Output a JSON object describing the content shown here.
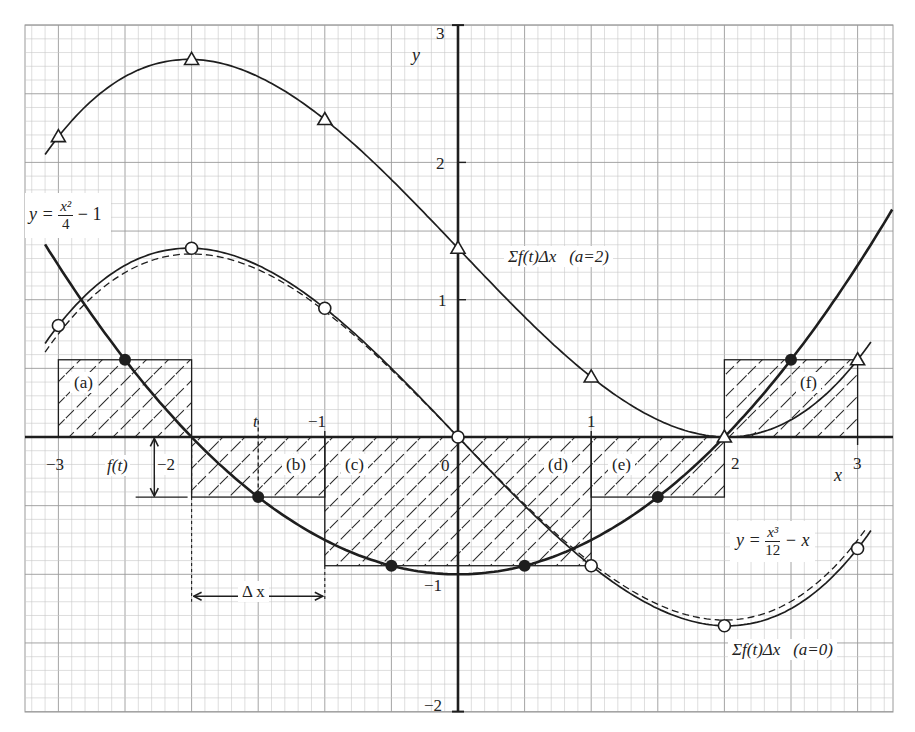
{
  "chart_data": {
    "type": "line",
    "title": "",
    "xlabel": "x",
    "ylabel": "y",
    "xlim": [
      -3.3,
      3.26
    ],
    "ylim": [
      -2.0,
      3.0
    ],
    "grid": true,
    "x_ticks": [
      "-3",
      "-2",
      "-1",
      "0",
      "1",
      "2",
      "3"
    ],
    "y_ticks": [
      "3",
      "2",
      "1",
      "0",
      "-1",
      "-2"
    ],
    "series": [
      {
        "name": "y = x^2/4 - 1",
        "label_text": "y = x²/4 − 1",
        "style": "solid-bold",
        "domain": [
          -3.1,
          3.26
        ],
        "markers": "filled-circle",
        "marker_points": [
          [
            -2.5,
            0.5625
          ],
          [
            -1.5,
            -0.4375
          ],
          [
            -0.5,
            -0.9375
          ],
          [
            0.5,
            -0.9375
          ],
          [
            1.5,
            -0.4375
          ],
          [
            2.5,
            0.5625
          ]
        ]
      },
      {
        "name": "Σf(t)Δx (a=0)",
        "label_text": "Σf(t)Δx   (a=0)",
        "style": "solid",
        "markers": "open-circle",
        "marker_points": [
          [
            -3,
            0.8125
          ],
          [
            -2,
            1.375
          ],
          [
            -1,
            0.9375
          ],
          [
            0,
            0
          ],
          [
            1,
            -0.9375
          ],
          [
            2,
            -1.375
          ],
          [
            3,
            -0.8125
          ]
        ]
      },
      {
        "name": "y = x^3/12 - x",
        "label_text": "y = x³/12 − x",
        "style": "dashed",
        "domain": [
          -3.1,
          3.05
        ]
      },
      {
        "name": "Σf(t)Δx (a=2)",
        "label_text": "Σf(t)Δx   (a=2)",
        "style": "solid",
        "markers": "open-triangle",
        "marker_points": [
          [
            -3,
            2.1875
          ],
          [
            -2,
            2.75
          ],
          [
            -1,
            2.3125
          ],
          [
            0,
            1.375
          ],
          [
            1,
            0.4375
          ],
          [
            2,
            0
          ],
          [
            3,
            0.5625
          ]
        ]
      }
    ],
    "rectangles": [
      {
        "label": "(a)",
        "x0": -3,
        "x1": -2,
        "height": 0.5625
      },
      {
        "label": "(b)",
        "x0": -2,
        "x1": -1,
        "height": -0.4375
      },
      {
        "label": "(c)",
        "x0": -1,
        "x1": 0,
        "height": -0.9375
      },
      {
        "label": "(d)",
        "x0": 0,
        "x1": 1,
        "height": -0.9375
      },
      {
        "label": "(e)",
        "x0": 1,
        "x1": 2,
        "height": -0.4375
      },
      {
        "label": "(f)",
        "x0": 2,
        "x1": 3,
        "height": 0.5625
      }
    ],
    "annotations": [
      "t",
      "f(t)",
      "Δx"
    ]
  },
  "labels": {
    "axis_x": "x",
    "axis_y": "y",
    "tick_x": {
      "m3": "−3",
      "m2": "−2",
      "m1": "−1",
      "zero": "0",
      "p1": "1",
      "p2": "2",
      "p3": "3"
    },
    "tick_y": {
      "p3": "3",
      "p2": "2",
      "p1": "1",
      "m1": "−1",
      "m2": "−2"
    },
    "t": "t",
    "ft": "f(t)",
    "dx": "Δ x",
    "rect_a": "(a)",
    "rect_b": "(b)",
    "rect_c": "(c)",
    "rect_d": "(d)",
    "rect_e": "(e)",
    "rect_f": "(f)",
    "parabola_lhs": "y =",
    "parabola_num": "x²",
    "parabola_den": "4",
    "parabola_rhs": "− 1",
    "cubic_lhs": "y =",
    "cubic_num": "x³",
    "cubic_den": "12",
    "cubic_rhs": "− x",
    "sum_a2": "Σf(t)Δx   (a=2)",
    "sum_a0": "Σf(t)Δx   (a=0)"
  },
  "layout": {
    "origin_px": [
      458,
      437
    ],
    "unit_x_px": 133.2,
    "unit_y_px": 137.3,
    "frame": [
      25,
      25,
      893,
      712
    ],
    "colors": {
      "ink": "#1e1e1e",
      "grid_fine": "#c8c8c8",
      "grid_major": "#9a9a9a",
      "background": "#ffffff"
    }
  }
}
